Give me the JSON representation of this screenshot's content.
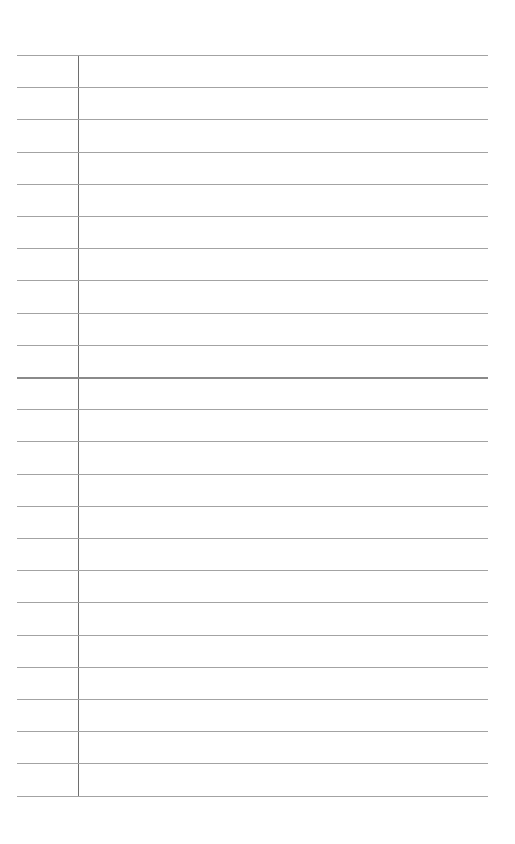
{
  "page": {
    "type": "lined-paper",
    "background_color": "#ffffff",
    "rule_color": "#a3a3a3",
    "margin_color": "#6e6e6e",
    "rule_count": 24,
    "first_rule_y": 55,
    "rule_spacing": 32.2,
    "emphasized_rule_index": 10,
    "margin_x": 78,
    "text": []
  }
}
